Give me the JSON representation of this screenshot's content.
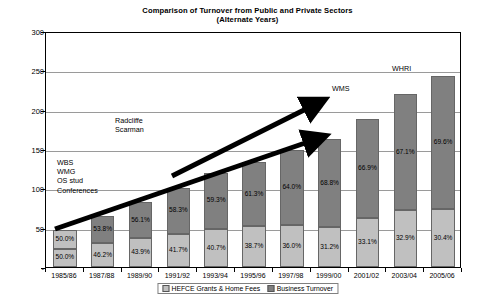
{
  "chart_data": {
    "type": "bar",
    "title": "Comparison of Turnover from Public and Private Sectors",
    "subtitle": "(Alternate Years)",
    "xlabel": "",
    "ylabel": "£Millions",
    "ylim": [
      0,
      300
    ],
    "yticks": [
      "-",
      "50",
      "100",
      "150",
      "200",
      "250",
      "300"
    ],
    "ytick_values": [
      0,
      50,
      100,
      150,
      200,
      250,
      300
    ],
    "grid": true,
    "stacked": true,
    "legend_position": "bottom",
    "categories": [
      "1985/86",
      "1987/88",
      "1989/90",
      "1991/92",
      "1993/94",
      "1995/96",
      "1997/98",
      "1999/00",
      "2001/02",
      "2003/04",
      "2005/06"
    ],
    "series": [
      {
        "name": "HEFCE Grants & Home Fees",
        "color": "#c0c0c0",
        "values": [
          23.5,
          30.0,
          36.4,
          42.1,
          48.8,
          51.5,
          53.6,
          50.9,
          62.2,
          72.4,
          73.9
        ],
        "labels": [
          "50.0%",
          "46.2%",
          "43.9%",
          "41.7%",
          "40.7%",
          "38.7%",
          "36.0%",
          "31.2%",
          "33.1%",
          "32.9%",
          "30.4%"
        ]
      },
      {
        "name": "Business Turnover",
        "color": "#808080",
        "values": [
          23.5,
          35.0,
          46.6,
          58.9,
          71.2,
          81.5,
          95.4,
          112.1,
          125.8,
          147.6,
          169.1
        ],
        "labels": [
          "50.0%",
          "53.8%",
          "56.1%",
          "58.3%",
          "59.3%",
          "61.3%",
          "64.0%",
          "68.8%",
          "66.9%",
          "67.1%",
          "69.6%"
        ]
      }
    ],
    "totals": [
      47,
      65,
      83,
      101,
      120,
      133,
      149,
      163,
      188,
      220,
      243
    ],
    "annotations": [
      {
        "name": "wbs-group",
        "text": "WBS\nWMG\nOS stud\nConferences",
        "x": 57,
        "y": 158
      },
      {
        "name": "radcliffe-scarman",
        "text": "Radcliffe\nScarman",
        "x": 115,
        "y": 116
      },
      {
        "name": "wms",
        "text": "WMS",
        "x": 332,
        "y": 84
      },
      {
        "name": "whri",
        "text": "WHRI",
        "x": 392,
        "y": 64
      }
    ]
  }
}
